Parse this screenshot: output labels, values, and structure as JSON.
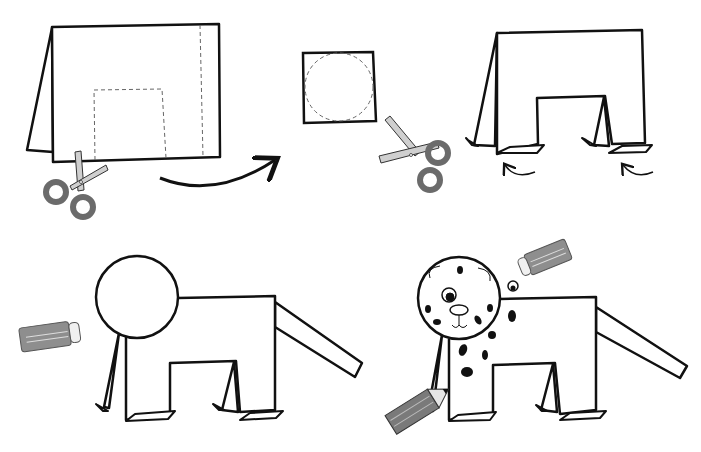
{
  "diagram": {
    "kind": "paper craft instructions - folded paper dalmatian dog",
    "steps": [
      {
        "step": 1,
        "description": "Fold paper card in half; cut out rectangle (dashed) from bottom; fold flap along dashed line",
        "tool": "scissors-icon"
      },
      {
        "step": 2,
        "description": "Cut a circle from a square piece of paper",
        "tool": "scissors-icon"
      },
      {
        "step": 3,
        "description": "Fold the feet outward",
        "arrows": "curved-arrow-icon"
      },
      {
        "step": 4,
        "description": "Glue the circle head and a tail strip",
        "tool": "glue-stick-icon"
      },
      {
        "step": 5,
        "description": "Glue googly eyes and draw face and spots",
        "tool": [
          "glue-stick-icon",
          "pencil-icon"
        ]
      }
    ],
    "colors": {
      "line": "#111111",
      "tool_gray": "#7a7a7a",
      "tool_light": "#cfcfcf",
      "handle_dark": "#6b6b6b",
      "spot": "#111111"
    }
  }
}
